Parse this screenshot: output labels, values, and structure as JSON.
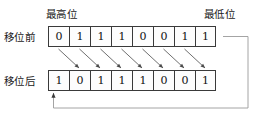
{
  "figure": {
    "colors": {
      "cell_border": "#3a3a3a",
      "arrow": "#4a4a4a",
      "wire": "#8a8a8a",
      "text": "#1a1a1a",
      "background": "#ffffff"
    }
  },
  "labels": {
    "msb": "最高位",
    "lsb": "最低位",
    "before": "移位前",
    "after": "移位后"
  },
  "rows": {
    "before": {
      "name": "移位前",
      "bits": [
        "0",
        "1",
        "1",
        "1",
        "0",
        "0",
        "1",
        "1"
      ]
    },
    "after": {
      "name": "移位后",
      "bits": [
        "1",
        "0",
        "1",
        "1",
        "1",
        "0",
        "0",
        "1"
      ]
    }
  },
  "arrows": {
    "diagonal_count": 8,
    "diagonal_note": "位 i 移到位 i+1",
    "wrap_note": "最低位回送到最高位"
  }
}
